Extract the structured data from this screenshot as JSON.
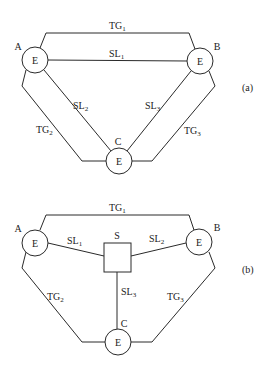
{
  "diagram_a": {
    "caption": "(a)",
    "nodes": [
      {
        "id": "A",
        "label": "A",
        "inner": "E"
      },
      {
        "id": "B",
        "label": "B",
        "inner": "E"
      },
      {
        "id": "C",
        "label": "C",
        "inner": "E"
      }
    ],
    "links": {
      "TG1": {
        "base": "TG",
        "sub": "1"
      },
      "TG2": {
        "base": "TG",
        "sub": "2"
      },
      "TG3": {
        "base": "TG",
        "sub": "3"
      },
      "SL1": {
        "base": "SL",
        "sub": "1"
      },
      "SL2": {
        "base": "SL",
        "sub": "2"
      },
      "SL3": {
        "base": "SL",
        "sub": "3"
      }
    }
  },
  "diagram_b": {
    "caption": "(b)",
    "nodes": [
      {
        "id": "A",
        "label": "A",
        "inner": "E"
      },
      {
        "id": "B",
        "label": "B",
        "inner": "E"
      },
      {
        "id": "C",
        "label": "C",
        "inner": "E"
      }
    ],
    "switch": {
      "label": "S"
    },
    "links": {
      "TG1": {
        "base": "TG",
        "sub": "1"
      },
      "TG2": {
        "base": "TG",
        "sub": "2"
      },
      "TG3": {
        "base": "TG",
        "sub": "3"
      },
      "SL1": {
        "base": "SL",
        "sub": "1"
      },
      "SL2": {
        "base": "SL",
        "sub": "2"
      },
      "SL3": {
        "base": "SL",
        "sub": "3"
      }
    }
  }
}
